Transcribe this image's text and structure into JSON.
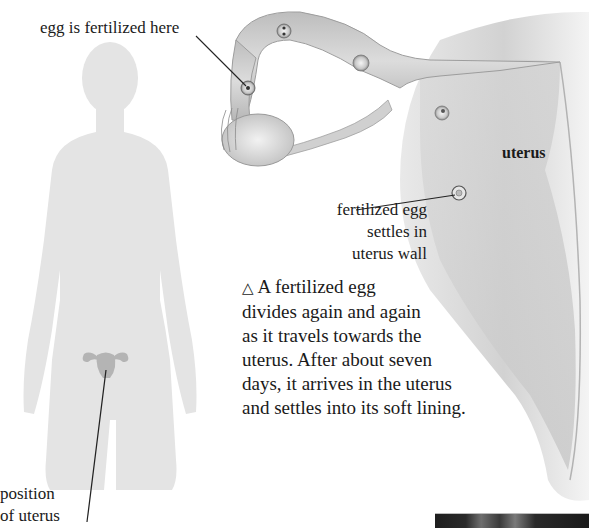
{
  "labels": {
    "fertilized_here": "egg is fertilized here",
    "settles_line1": "fertilized egg",
    "settles_line2": "settles in",
    "settles_line3": "uterus wall",
    "uterus": "uterus",
    "position_line1": "position",
    "position_line2": "of uterus"
  },
  "caption": {
    "icon": "triangle-up-icon",
    "glyph": "△",
    "lines": [
      "A fertilized egg",
      "divides again and again",
      "as it travels towards the",
      "uterus. After about seven",
      "days, it arrives in the uterus",
      "and settles into its soft lining."
    ]
  },
  "colors": {
    "silhouette": "#e4e4e4",
    "uterus_icon": "#b4b4b4",
    "tube_fill": "#cfcfcf",
    "uterus_fill": "#d6d6d6",
    "text": "#1a1a1a",
    "photo_strip": "#1e1e1e"
  }
}
